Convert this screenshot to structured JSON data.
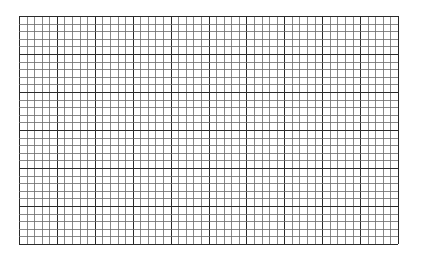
{
  "grid": {
    "left": 19,
    "top": 16,
    "width": 379,
    "height": 228,
    "columns": 50,
    "rows": 30,
    "major_every": 5,
    "colors": {
      "background": "#ffffff",
      "minor_line": "#6a6a6a",
      "major_line": "#2a2a2a",
      "border": "#2a2a2a"
    }
  }
}
